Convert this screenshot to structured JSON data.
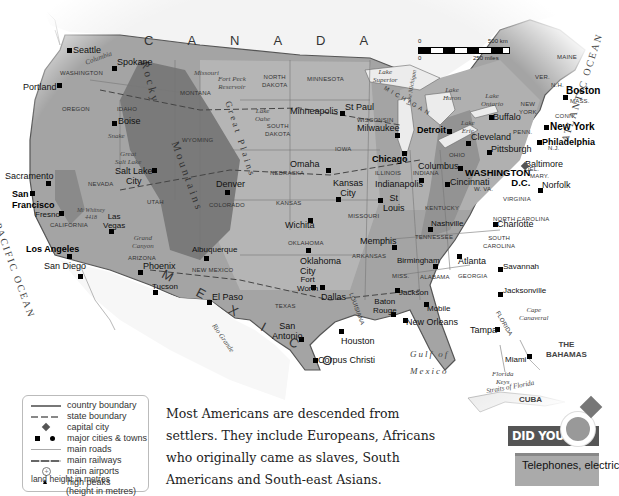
{
  "map": {
    "title_region": "United States of America",
    "countries": [
      "C A N A D A",
      "M E X I C O",
      "CUBA",
      "THE BAHAMAS"
    ],
    "oceans": [
      "PACIFIC OCEAN",
      "ATLANTIC OCEAN"
    ],
    "water_labels": [
      "Gulf of",
      "Mexico",
      "Lake Superior",
      "Lake Huron",
      "Lake Ontario",
      "Lake Erie",
      "Lake Michigan",
      "Great Salt Lake",
      "Lake Oahe",
      "Fort Peck Reservoir",
      "Straits of Florida"
    ],
    "rivers": [
      "Columbia",
      "Snake",
      "Missouri",
      "Colorado",
      "Rio Grande",
      "Mississippi",
      "Arkansas",
      "Ohio",
      "Hudson"
    ],
    "mountains": [
      "Rocky Mountains",
      "Great Plains",
      "Sierra Nevada",
      "Appalachian Mountains"
    ],
    "landmarks": [
      "Grand Canyon",
      "Mt Whitney 4418",
      "Cape Canaveral",
      "Florida Keys"
    ],
    "states": [
      "WASHINGTON",
      "OREGON",
      "IDAHO",
      "MONTANA",
      "WYOMING",
      "NEVADA",
      "UTAH",
      "CALIFORNIA",
      "ARIZONA",
      "NEW MEXICO",
      "COLORADO",
      "NORTH DAKOTA",
      "SOUTH DAKOTA",
      "NEBRASKA",
      "KANSAS",
      "OKLAHOMA",
      "TEXAS",
      "MINNESOTA",
      "IOWA",
      "MISSOURI",
      "ARKANSAS",
      "LOUISIANA",
      "WISCONSIN",
      "ILLINOIS",
      "INDIANA",
      "OHIO",
      "KENTUCKY",
      "TENNESSEE",
      "MISS.",
      "ALABAMA",
      "GEORGIA",
      "FLORIDA",
      "SOUTH CAROLINA",
      "NORTH CAROLINA",
      "VIRGINIA",
      "W. VA.",
      "PENN.",
      "NEW YORK",
      "VER.",
      "N.H.",
      "MAINE",
      "MASS.",
      "CONN.",
      "N.J.",
      "DEL.",
      "MARY.",
      "MICHIGAN"
    ],
    "capital": "WASHINGTON D.C.",
    "major_cities": [
      "Seattle",
      "Portland",
      "Spokane",
      "Boise",
      "Sacramento",
      "San Francisco",
      "Fresno",
      "Las Vegas",
      "Los Angeles",
      "San Diego",
      "Phoenix",
      "Tucson",
      "Salt Lake City",
      "Denver",
      "Albuquerque",
      "El Paso",
      "Minneapolis",
      "St Paul",
      "Omaha",
      "Kansas City",
      "Wichita",
      "Oklahoma City",
      "Fort Worth",
      "Dallas",
      "San Antonio",
      "Houston",
      "Corpus Christi",
      "Milwaukee",
      "Chicago",
      "Detroit",
      "Indianapolis",
      "St Louis",
      "Memphis",
      "Columbus",
      "Cincinnati",
      "Cleveland",
      "Buffalo",
      "Pittsburgh",
      "Nashville",
      "Birmingham",
      "Jackson",
      "Baton Rouge",
      "New Orleans",
      "Mobile",
      "Atlanta",
      "Charlotte",
      "Savannah",
      "Jacksonville",
      "Tampa",
      "Miami",
      "Norfolk",
      "Baltimore",
      "Philadelphia",
      "New York",
      "Boston"
    ]
  },
  "scale_bar": {
    "km_start": "0",
    "km_end": "500 km",
    "mi_start": "0",
    "mi_end": "250 miles"
  },
  "legend": {
    "items": [
      {
        "label": "country boundary",
        "symbol": "solid-line"
      },
      {
        "label": "state boundary",
        "symbol": "dashed-line"
      },
      {
        "label": "capital city",
        "symbol": "diamond"
      },
      {
        "label": "major cities & towns",
        "symbol": "square-dot"
      },
      {
        "label": "main roads",
        "symbol": "thin-line"
      },
      {
        "label": "main railways",
        "symbol": "rail-line"
      },
      {
        "label": "main airports",
        "symbol": "airport"
      },
      {
        "label": "high peaks",
        "symbol": "triangle"
      },
      {
        "label": "(height in metres)",
        "symbol": "none"
      }
    ],
    "land_height_label": "land height in metres"
  },
  "body_text": {
    "lines": [
      "Most Americans are descended from",
      "settlers. They include Europeans, Africans",
      "who originally came as slaves, South",
      "Americans and South-east Asians."
    ]
  },
  "did_you_know": {
    "heading": "DID YOU KNOW?",
    "text": "Telephones, electric"
  },
  "colors": {
    "land": "#9a9a9a",
    "land_light": "#b8b8b8",
    "mountain": "#6e6e6e",
    "sea": "#ffffff",
    "boundary": "#555555",
    "dyk_band": "#555555",
    "dyk_box": "#aaaaaa"
  }
}
